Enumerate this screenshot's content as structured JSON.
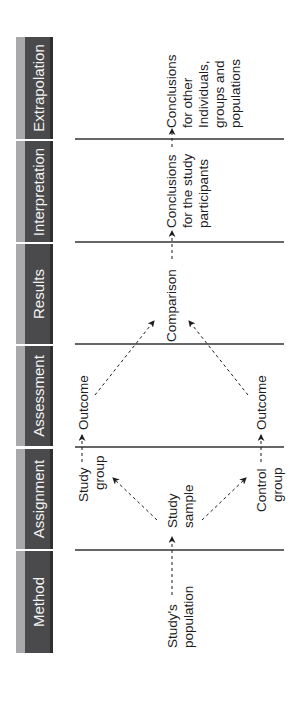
{
  "stages": [
    {
      "id": "extrapolation",
      "label": "Extrapolation"
    },
    {
      "id": "interpretation",
      "label": "Interpretation"
    },
    {
      "id": "results",
      "label": "Results"
    },
    {
      "id": "assessment",
      "label": "Assessment"
    },
    {
      "id": "assignment",
      "label": "Assignment"
    },
    {
      "id": "method",
      "label": "Method"
    }
  ],
  "nodes": {
    "population": {
      "line1": "Study's",
      "line2": "population"
    },
    "sample": {
      "line1": "Study",
      "line2": "sample"
    },
    "study_group": {
      "line1": "Study",
      "line2": "group"
    },
    "control_group": {
      "line1": "Control",
      "line2": "group"
    },
    "outcome_study": {
      "line1": "Outcome"
    },
    "outcome_control": {
      "line1": "Outcome"
    },
    "comparison": {
      "line1": "Comparison"
    },
    "conclusions_participants": {
      "line1": "Conclusions",
      "line2": "for the study",
      "line3": "participants"
    },
    "conclusions_other": {
      "line1": "Conclusions",
      "line2": "for other",
      "line3": "Individuals,",
      "line4": "groups and",
      "line5": "populations"
    }
  },
  "colors": {
    "tab_face": "#4a4a4c",
    "tab_bevel": "#a9a9ab",
    "tab_text": "#f2f2f2",
    "line": "#333333",
    "text": "#1d1d1d"
  }
}
